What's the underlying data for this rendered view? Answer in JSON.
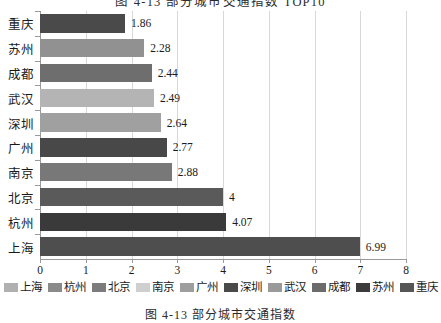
{
  "chart_data": {
    "type": "bar",
    "orientation": "horizontal",
    "title": "图 4-13  部分城市交通指数 TOP10",
    "caption": "图 4-13  部分城市交通指数",
    "categories": [
      "重庆",
      "苏州",
      "成都",
      "武汉",
      "深圳",
      "广州",
      "南京",
      "北京",
      "杭州",
      "上海"
    ],
    "values": [
      1.86,
      2.28,
      2.44,
      2.49,
      2.64,
      2.77,
      2.88,
      4,
      4.07,
      6.99
    ],
    "value_labels": [
      "1.86",
      "2.28",
      "2.44",
      "2.49",
      "2.64",
      "2.77",
      "2.88",
      "4",
      "4.07",
      "6.99"
    ],
    "bar_colors": [
      "#4a4a4a",
      "#919191",
      "#6e6e6e",
      "#b4b4b4",
      "#a0a0a0",
      "#484848",
      "#787878",
      "#5a5a5a",
      "#3a3a3a",
      "#4e4e4e"
    ],
    "xlabel": "",
    "ylabel": "",
    "xlim": [
      0,
      8
    ],
    "xticks": [
      0,
      1,
      2,
      3,
      4,
      5,
      6,
      7,
      8
    ],
    "xtick_labels": [
      "0",
      "1",
      "2",
      "3",
      "4",
      "5",
      "6",
      "7",
      "8"
    ],
    "grid": true,
    "legend_position": "bottom",
    "legend": [
      {
        "label": "上海",
        "color": "#b0b0b0"
      },
      {
        "label": "杭州",
        "color": "#8a8a8a"
      },
      {
        "label": "北京",
        "color": "#7c7c7c"
      },
      {
        "label": "南京",
        "color": "#cfcfcf"
      },
      {
        "label": "广州",
        "color": "#9e9e9e"
      },
      {
        "label": "深圳",
        "color": "#4a4a4a"
      },
      {
        "label": "武汉",
        "color": "#9a9a9a"
      },
      {
        "label": "成都",
        "color": "#6b6b6b"
      },
      {
        "label": "苏州",
        "color": "#3c3c3c"
      },
      {
        "label": "重庆",
        "color": "#565656"
      }
    ]
  }
}
